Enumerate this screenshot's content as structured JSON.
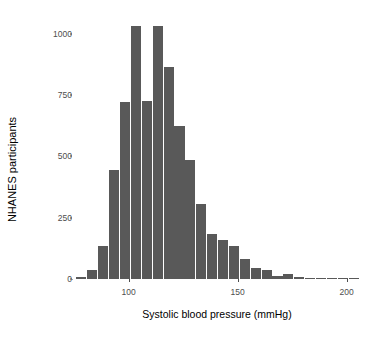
{
  "chart_data": {
    "type": "bar",
    "title": "",
    "xlabel": "Systolic blood pressure (mmHg)",
    "ylabel": "NHANES participants",
    "xlim": [
      74,
      208
    ],
    "ylim": [
      0,
      1080
    ],
    "grid": false,
    "legend": null,
    "bin_width": 5,
    "bar_color": "#595959",
    "x_ticks": [
      {
        "value": 100,
        "label": "100"
      },
      {
        "value": 150,
        "label": "150"
      },
      {
        "value": 200,
        "label": "200"
      }
    ],
    "y_ticks": [
      {
        "value": 0,
        "label": "0"
      },
      {
        "value": 250,
        "label": "250"
      },
      {
        "value": 500,
        "label": "500"
      },
      {
        "value": 750,
        "label": "750"
      },
      {
        "value": 1000,
        "label": "1000"
      }
    ],
    "bins": [
      {
        "x0": 76,
        "x1": 81,
        "center": 78.5,
        "value": 10
      },
      {
        "x0": 81,
        "x1": 86,
        "center": 83.5,
        "value": 35
      },
      {
        "x0": 86,
        "x1": 91,
        "center": 88.5,
        "value": 135
      },
      {
        "x0": 91,
        "x1": 96,
        "center": 93.5,
        "value": 445
      },
      {
        "x0": 96,
        "x1": 101,
        "center": 98.5,
        "value": 720
      },
      {
        "x0": 101,
        "x1": 106,
        "center": 103.5,
        "value": 1030
      },
      {
        "x0": 106,
        "x1": 111,
        "center": 108.5,
        "value": 725
      },
      {
        "x0": 111,
        "x1": 116,
        "center": 113.5,
        "value": 1030
      },
      {
        "x0": 116,
        "x1": 121,
        "center": 118.5,
        "value": 865
      },
      {
        "x0": 121,
        "x1": 126,
        "center": 123.5,
        "value": 625
      },
      {
        "x0": 126,
        "x1": 131,
        "center": 128.5,
        "value": 485
      },
      {
        "x0": 131,
        "x1": 136,
        "center": 133.5,
        "value": 305
      },
      {
        "x0": 136,
        "x1": 141,
        "center": 138.5,
        "value": 185
      },
      {
        "x0": 141,
        "x1": 146,
        "center": 143.5,
        "value": 160
      },
      {
        "x0": 146,
        "x1": 151,
        "center": 148.5,
        "value": 135
      },
      {
        "x0": 151,
        "x1": 156,
        "center": 153.5,
        "value": 80
      },
      {
        "x0": 156,
        "x1": 161,
        "center": 158.5,
        "value": 45
      },
      {
        "x0": 161,
        "x1": 166,
        "center": 163.5,
        "value": 35
      },
      {
        "x0": 166,
        "x1": 171,
        "center": 168.5,
        "value": 12
      },
      {
        "x0": 171,
        "x1": 176,
        "center": 173.5,
        "value": 20
      },
      {
        "x0": 176,
        "x1": 181,
        "center": 178.5,
        "value": 8
      },
      {
        "x0": 181,
        "x1": 186,
        "center": 183.5,
        "value": 6
      },
      {
        "x0": 186,
        "x1": 191,
        "center": 188.5,
        "value": 6
      },
      {
        "x0": 191,
        "x1": 196,
        "center": 193.5,
        "value": 5
      },
      {
        "x0": 196,
        "x1": 201,
        "center": 198.5,
        "value": 4
      },
      {
        "x0": 201,
        "x1": 206,
        "center": 203.5,
        "value": 4
      }
    ]
  }
}
